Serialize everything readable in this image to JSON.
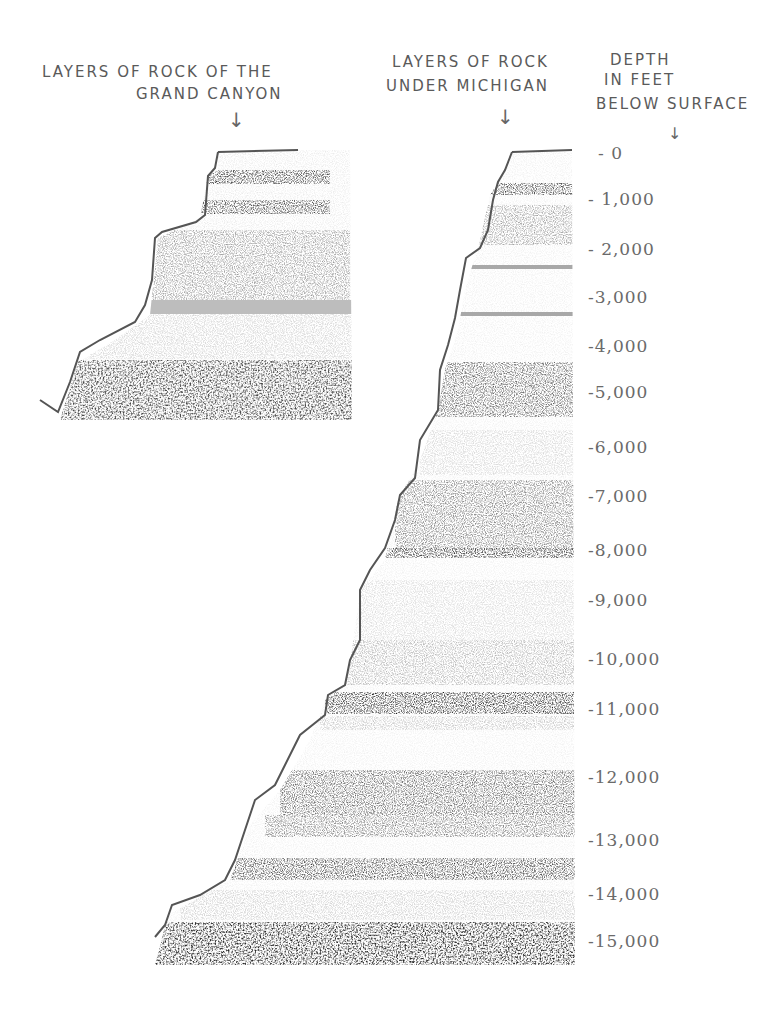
{
  "labels": {
    "grand_canyon": [
      "LAYERS OF ROCK OF THE",
      "GRAND CANYON"
    ],
    "michigan": [
      "LAYERS OF ROCK",
      "UNDER MICHIGAN"
    ],
    "depth": [
      "DEPTH",
      "IN FEET",
      "BELOW SURFACE"
    ],
    "arrow": "↓"
  },
  "depth_scale": {
    "unit": "feet below surface",
    "ticks": [
      "- 0",
      "- 1,000",
      "- 2,000",
      "-3,000",
      "-4,000",
      "-5,000",
      "-6,000",
      "-7,000",
      "-8,000",
      "-9,000",
      "-10,000",
      "-11,000",
      "-12,000",
      "-13,000",
      "-14,000",
      "-15,000"
    ],
    "tick_y": [
      155,
      200,
      250,
      298,
      347,
      393,
      448,
      497,
      551,
      601,
      660,
      710,
      778,
      841,
      895,
      942
    ]
  },
  "colors": {
    "pencil_dark": "#3a3a3a",
    "pencil_mid": "#8a8a8a",
    "pencil_light": "#c8c8c8",
    "outline": "#555555"
  }
}
